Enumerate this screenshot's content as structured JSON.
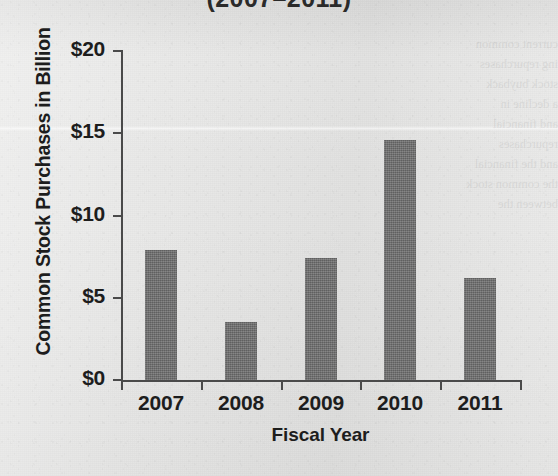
{
  "page": {
    "background_color": "#e9e9e8",
    "ghost_text_lines": [
      "current common",
      "ing repurchases",
      "stock buyback",
      "a decline in",
      "and financial",
      "repurchases",
      "and the financial",
      "the common stock",
      "between the"
    ]
  },
  "chart_data": {
    "type": "bar",
    "title": "(2007–2011)",
    "subtitle": "",
    "categories": [
      "2007",
      "2008",
      "2009",
      "2010",
      "2011"
    ],
    "values": [
      7.9,
      3.5,
      7.4,
      14.6,
      6.2
    ],
    "series": [
      {
        "name": "Common Stock Purchases",
        "values": [
          7.9,
          3.5,
          7.4,
          14.6,
          6.2
        ]
      }
    ],
    "xlabel": "Fiscal Year",
    "ylabel": "Common Stock Purchases in Billion",
    "ylim": [
      0,
      20
    ],
    "y_ticks": [
      0,
      5,
      10,
      15,
      20
    ],
    "y_tick_labels": [
      "$0",
      "$5",
      "$10",
      "$15",
      "$20"
    ],
    "grid": false,
    "legend": false,
    "legend_position": "none",
    "bar_color": "#6d6d6d",
    "axis_color": "#4a4a4a",
    "text_color": "#1d1d1d",
    "value_unit": "Billion USD"
  }
}
